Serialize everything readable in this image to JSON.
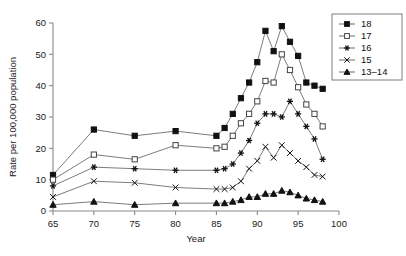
{
  "chart_data": {
    "type": "line",
    "title": "",
    "xlabel": "Year",
    "ylabel": "Rate per 100,000 population",
    "xlim": [
      65,
      100
    ],
    "ylim": [
      0,
      60
    ],
    "xticks": [
      65,
      70,
      75,
      80,
      85,
      90,
      95,
      100
    ],
    "yticks": [
      0,
      10,
      20,
      30,
      40,
      50,
      60
    ],
    "grid": false,
    "legend_position": "top-right",
    "x": [
      65,
      70,
      75,
      80,
      85,
      86,
      87,
      88,
      89,
      90,
      91,
      92,
      93,
      94,
      95,
      96,
      97,
      98
    ],
    "series": [
      {
        "name": "18",
        "marker": "filled-square",
        "values": [
          11.5,
          26.0,
          24.0,
          25.5,
          24.0,
          26.5,
          31.0,
          36.0,
          41.0,
          47.5,
          57.5,
          51.0,
          59.0,
          54.0,
          49.5,
          41.0,
          40.0,
          39.0
        ]
      },
      {
        "name": "17",
        "marker": "open-square",
        "values": [
          10.0,
          18.0,
          16.5,
          21.0,
          20.0,
          20.5,
          24.0,
          28.0,
          31.0,
          35.0,
          41.5,
          41.0,
          50.0,
          45.0,
          39.5,
          34.0,
          31.0,
          27.0
        ]
      },
      {
        "name": "16",
        "marker": "asterisk",
        "values": [
          8.0,
          14.0,
          13.5,
          13.0,
          13.0,
          13.5,
          15.0,
          18.5,
          22.5,
          28.0,
          31.0,
          31.0,
          30.0,
          35.0,
          31.0,
          27.0,
          23.0,
          16.5
        ]
      },
      {
        "name": "15",
        "marker": "x",
        "values": [
          4.5,
          9.5,
          9.0,
          7.5,
          7.0,
          7.0,
          7.5,
          9.5,
          13.5,
          16.0,
          20.5,
          17.0,
          21.0,
          18.5,
          16.0,
          14.0,
          11.5,
          11.0
        ]
      },
      {
        "name": "13–14",
        "marker": "filled-triangle",
        "values": [
          2.0,
          3.0,
          2.0,
          2.5,
          2.5,
          2.5,
          3.0,
          3.5,
          4.5,
          4.5,
          5.5,
          5.5,
          6.5,
          6.0,
          5.0,
          4.0,
          3.5,
          3.0
        ]
      }
    ]
  },
  "legend": {
    "entries": [
      {
        "label": "18"
      },
      {
        "label": "17"
      },
      {
        "label": "16"
      },
      {
        "label": "15"
      },
      {
        "label": "13–14"
      }
    ]
  }
}
